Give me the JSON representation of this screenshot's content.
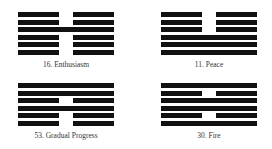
{
  "hexagrams": [
    {
      "number": 16,
      "label": "16. Enthusiasm",
      "lines_top_to_bottom": [
        "broken",
        "broken",
        "solid",
        "broken",
        "broken",
        "broken"
      ],
      "x": 18,
      "y": 12
    },
    {
      "number": 11,
      "label": "11. Peace",
      "lines_top_to_bottom": [
        "broken",
        "broken",
        "broken",
        "solid",
        "solid",
        "solid"
      ],
      "x": 161,
      "y": 12
    },
    {
      "number": 53,
      "label": "53. Gradual Progress",
      "lines_top_to_bottom": [
        "solid",
        "solid",
        "broken",
        "solid",
        "broken",
        "broken"
      ],
      "x": 18,
      "y": 83
    },
    {
      "number": 30,
      "label": "30. Fire",
      "lines_top_to_bottom": [
        "solid",
        "broken",
        "solid",
        "solid",
        "broken",
        "solid"
      ],
      "x": 161,
      "y": 83
    }
  ],
  "colors": {
    "line": "#111111",
    "label": "#333333",
    "background": "#ffffff"
  }
}
